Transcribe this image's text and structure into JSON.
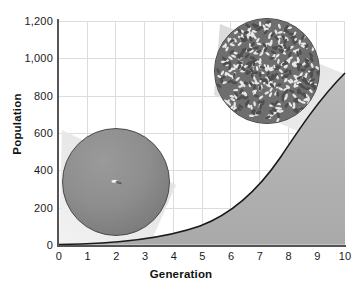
{
  "chart_data": {
    "type": "line",
    "title": "",
    "subtitle": "",
    "xlabel": "Generation",
    "ylabel": "Population",
    "xlim": [
      0,
      10
    ],
    "ylim": [
      0,
      1200
    ],
    "grid": true,
    "legend": null,
    "xticks": [
      "0",
      "1",
      "2",
      "3",
      "4",
      "5",
      "6",
      "7",
      "8",
      "9",
      "10"
    ],
    "yticks": [
      "0",
      "200",
      "400",
      "600",
      "800",
      "1,000",
      "1,200"
    ],
    "xtick_values": [
      0,
      1,
      2,
      3,
      4,
      5,
      6,
      7,
      8,
      9,
      10
    ],
    "ytick_values": [
      0,
      200,
      400,
      600,
      800,
      1000,
      1200
    ],
    "series": [
      {
        "name": "Population growth",
        "fill": "area-right-of-curve",
        "x": [
          0,
          1,
          2,
          3,
          4,
          5,
          6,
          7,
          8,
          9,
          10
        ],
        "values": [
          2,
          4,
          8,
          16,
          31,
          62,
          123,
          245,
          440,
          690,
          1000
        ]
      }
    ],
    "annotations": [
      {
        "name": "single-fly-inset",
        "caption": "",
        "at_generation": 1.5,
        "at_population": 300,
        "description": "one fly"
      },
      {
        "name": "crowded-flies-inset",
        "caption": "",
        "at_generation": 8,
        "at_population": 920,
        "description": "many flies"
      }
    ]
  },
  "axes": {
    "x": {
      "label": "Generation",
      "ticks": [
        "0",
        "1",
        "2",
        "3",
        "4",
        "5",
        "6",
        "7",
        "8",
        "9",
        "10"
      ]
    },
    "y": {
      "label": "Population",
      "ticks": [
        "1,200",
        "1,000",
        "800",
        "600",
        "400",
        "200",
        "0"
      ]
    }
  },
  "colors": {
    "background": "#ffffff",
    "grid": "#dcdcdc",
    "axis": "#555555",
    "curve": "#1a1a1a",
    "area_fill": "#b3b3b3",
    "cone_fill": "#e3e3e3",
    "inset_border": "#4a4a4a",
    "text": "#1a1a1a"
  }
}
